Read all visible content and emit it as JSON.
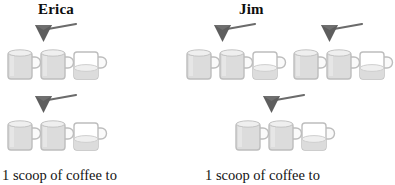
{
  "figure": {
    "type": "ratio-diagram",
    "background_color": "#ffffff",
    "mug_outline_color": "#b9b9b9",
    "mug_fill_color": "#d8d8d8",
    "scoop_color": "#595959",
    "text_color": "#111111"
  },
  "columns": [
    {
      "id": "erica",
      "title": "Erica",
      "caption": "1 scoop of coffee to",
      "rows": [
        {
          "groups": [
            {
              "scoops": 1,
              "mugs": [
                {
                  "fill": "full"
                },
                {
                  "fill": "full"
                },
                {
                  "fill": "partial"
                }
              ]
            }
          ]
        },
        {
          "groups": [
            {
              "scoops": 1,
              "mugs": [
                {
                  "fill": "full"
                },
                {
                  "fill": "full"
                },
                {
                  "fill": "partial"
                }
              ]
            }
          ]
        }
      ],
      "total_scoops": 2,
      "total_mugs": 5
    },
    {
      "id": "jim",
      "title": "Jim",
      "caption": "1 scoop of coffee to",
      "rows": [
        {
          "groups": [
            {
              "scoops": 1,
              "mugs": [
                {
                  "fill": "full"
                },
                {
                  "fill": "full"
                },
                {
                  "fill": "partial"
                }
              ]
            },
            {
              "scoops": 1,
              "mugs": [
                {
                  "fill": "full"
                },
                {
                  "fill": "full"
                },
                {
                  "fill": "partial"
                }
              ]
            }
          ]
        },
        {
          "groups": [
            {
              "scoops": 1,
              "mugs": [
                {
                  "fill": "full"
                },
                {
                  "fill": "full"
                },
                {
                  "fill": "partial"
                }
              ]
            }
          ]
        }
      ],
      "total_scoops": 3,
      "total_mugs": 7.5
    }
  ],
  "icons": {
    "scoop": "coffee-scoop-icon",
    "mug_full": "coffee-mug-full-icon",
    "mug_partial": "coffee-mug-partial-icon"
  }
}
